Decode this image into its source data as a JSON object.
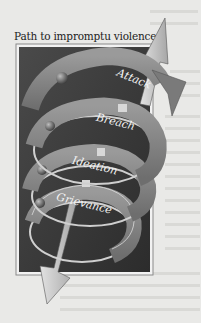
{
  "figure": {
    "title": "Path to impromptu violence",
    "stages": [
      {
        "label": "Grievance",
        "order": 1
      },
      {
        "label": "Ideation",
        "order": 2
      },
      {
        "label": "Breach",
        "order": 3
      },
      {
        "label": "Attack",
        "order": 4
      }
    ],
    "arrows": {
      "up": "upward-arrow",
      "down": "downward-arrow"
    },
    "colors": {
      "page": "#e9e9e7",
      "panel": "#3a3a3a",
      "panel_border": "#9a9a9a",
      "band": "#8c8c8c",
      "band_edge": "#d6d6d6",
      "arrow": "#c9c9c9",
      "text": "#1c1c1c"
    }
  }
}
